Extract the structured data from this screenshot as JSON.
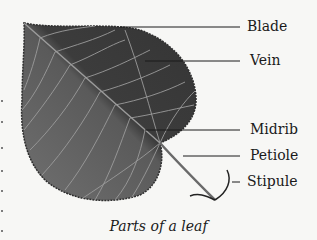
{
  "figure": {
    "caption": "Parts of a leaf",
    "labels": [
      {
        "id": "blade",
        "text": "Blade"
      },
      {
        "id": "vein",
        "text": "Vein"
      },
      {
        "id": "midrib",
        "text": "Midrib"
      },
      {
        "id": "petiole",
        "text": "Petiole"
      },
      {
        "id": "stipule",
        "text": "Stipule"
      }
    ],
    "colors": {
      "leaf_dark": "#3a3a3a",
      "leaf_light": "#6a6a6a",
      "vein": "#a9a9a9",
      "line": "#1a1a1a",
      "background": "#f7f7f5"
    }
  }
}
